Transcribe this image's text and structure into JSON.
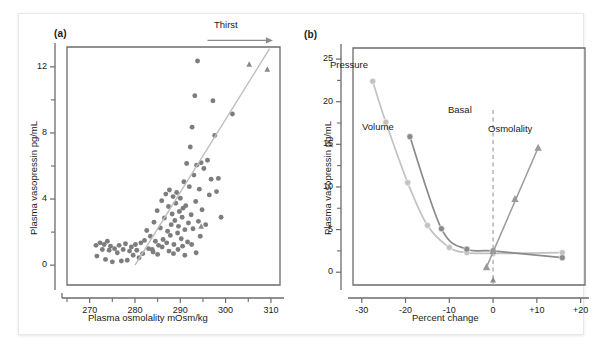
{
  "figure": {
    "panels": [
      {
        "letter": "(a)",
        "annotation": "Thirst",
        "xlabel": "Plasma osmolality mOsm/kg",
        "ylabel": "Plasma vasopressin pg/mL"
      },
      {
        "letter": "(b)",
        "annotation": "Basal",
        "xlabel": "Percent change",
        "ylabel": "Plasma vasopressin pg/mL",
        "series_labels": [
          "Pressure",
          "Volume",
          "Osmolality"
        ]
      }
    ]
  },
  "colors": {
    "frame": "#6b6b6b",
    "marker_dark": "#7d7d7d",
    "marker_light": "#b9b9b9",
    "line_light": "#c2c2c2",
    "line_dark": "#8a8a8a",
    "text": "#1a1a1a",
    "dashed": "#a8a8a8"
  },
  "chart_data": [
    {
      "type": "scatter",
      "panel": "(a)",
      "title": "",
      "xlabel": "Plasma osmolality mOsm/kg",
      "ylabel": "Plasma vasopressin pg/mL",
      "xlim": [
        265,
        312
      ],
      "ylim": [
        -1.2,
        13.2
      ],
      "xticks": [
        270,
        280,
        290,
        300,
        310
      ],
      "xminorticks": [
        265,
        275,
        285,
        295,
        305
      ],
      "yticks": [
        0,
        4,
        8,
        12
      ],
      "yminorticks": [
        2,
        6,
        10
      ],
      "grid": false,
      "legend": false,
      "annotations": [
        {
          "text": "Thirst",
          "type": "arrow",
          "x_start": 296,
          "x_end": 310,
          "y": 13.6
        }
      ],
      "series": [
        {
          "name": "circles",
          "marker": "circle",
          "color": "#7d7d7d",
          "points": [
            [
              271.4,
              1.2
            ],
            [
              271.6,
              0.55
            ],
            [
              272.3,
              1.35
            ],
            [
              272.8,
              0.95
            ],
            [
              273.2,
              1.25
            ],
            [
              273.5,
              0.35
            ],
            [
              273.9,
              1.45
            ],
            [
              274.3,
              0.9
            ],
            [
              274.6,
              1.15
            ],
            [
              275.0,
              0.2
            ],
            [
              275.5,
              1.0
            ],
            [
              276.1,
              0.75
            ],
            [
              276.5,
              1.2
            ],
            [
              277.0,
              0.25
            ],
            [
              277.4,
              0.95
            ],
            [
              277.9,
              1.3
            ],
            [
              278.3,
              0.3
            ],
            [
              278.8,
              0.85
            ],
            [
              279.2,
              1.1
            ],
            [
              279.6,
              0.6
            ],
            [
              280.1,
              1.25
            ],
            [
              280.4,
              0.9
            ],
            [
              280.9,
              0.45
            ],
            [
              281.3,
              1.35
            ],
            [
              281.7,
              0.7
            ],
            [
              282.1,
              1.5
            ],
            [
              282.6,
              2.1
            ],
            [
              283.0,
              1.0
            ],
            [
              283.4,
              1.75
            ],
            [
              283.8,
              0.95
            ],
            [
              284.2,
              2.6
            ],
            [
              284.5,
              1.45
            ],
            [
              284.9,
              3.3
            ],
            [
              285.2,
              1.2
            ],
            [
              285.6,
              2.25
            ],
            [
              285.9,
              3.9
            ],
            [
              286.2,
              1.55
            ],
            [
              286.5,
              2.85
            ],
            [
              286.8,
              4.3
            ],
            [
              287.0,
              1.35
            ],
            [
              287.2,
              2.05
            ],
            [
              287.4,
              3.55
            ],
            [
              287.6,
              4.55
            ],
            [
              287.8,
              1.8
            ],
            [
              288.0,
              2.45
            ],
            [
              288.2,
              3.1
            ],
            [
              288.4,
              4.15
            ],
            [
              288.6,
              1.25
            ],
            [
              288.8,
              2.7
            ],
            [
              289.0,
              3.75
            ],
            [
              289.2,
              4.4
            ],
            [
              289.4,
              1.95
            ],
            [
              289.6,
              2.35
            ],
            [
              289.8,
              3.25
            ],
            [
              290.0,
              4.05
            ],
            [
              290.2,
              1.6
            ],
            [
              290.4,
              2.9
            ],
            [
              290.6,
              3.45
            ],
            [
              290.8,
              5.05
            ],
            [
              291.0,
              2.15
            ],
            [
              291.2,
              3.6
            ],
            [
              291.4,
              6.15
            ],
            [
              291.6,
              1.4
            ],
            [
              291.8,
              2.55
            ],
            [
              292.0,
              4.75
            ],
            [
              292.2,
              7.15
            ],
            [
              292.4,
              3.05
            ],
            [
              292.6,
              8.35
            ],
            [
              292.8,
              2.2
            ],
            [
              293.0,
              5.45
            ],
            [
              293.2,
              10.25
            ],
            [
              293.4,
              3.85
            ],
            [
              293.6,
              6.05
            ],
            [
              293.8,
              12.35
            ],
            [
              294.0,
              2.65
            ],
            [
              294.2,
              4.6
            ],
            [
              294.4,
              1.75
            ],
            [
              294.6,
              6.2
            ],
            [
              294.8,
              3.35
            ],
            [
              295.2,
              5.85
            ],
            [
              295.6,
              2.45
            ],
            [
              296.0,
              6.35
            ],
            [
              296.4,
              4.25
            ],
            [
              296.8,
              5.2
            ],
            [
              297.2,
              9.95
            ],
            [
              297.6,
              7.85
            ],
            [
              298.0,
              4.45
            ],
            [
              298.4,
              5.25
            ],
            [
              299.0,
              2.9
            ],
            [
              301.5,
              9.15
            ],
            [
              286.0,
              1.1
            ],
            [
              287.5,
              0.85
            ],
            [
              289.5,
              0.95
            ],
            [
              290.5,
              1.15
            ],
            [
              292.5,
              1.25
            ],
            [
              284.0,
              0.8
            ],
            [
              285.0,
              0.65
            ],
            [
              288.5,
              0.7
            ],
            [
              291.0,
              0.6
            ],
            [
              293.5,
              0.75
            ]
          ]
        },
        {
          "name": "triangles",
          "marker": "triangle",
          "color": "#8a8a8a",
          "points": [
            [
              294.6,
              2.35
            ],
            [
              305.2,
              12.15
            ],
            [
              309.2,
              11.85
            ]
          ]
        },
        {
          "name": "regression-line",
          "marker": "line",
          "color": "#bdbdbd",
          "points": [
            [
              280.0,
              0.0
            ],
            [
              309.7,
              13.1
            ]
          ]
        }
      ]
    },
    {
      "type": "line",
      "panel": "(b)",
      "title": "",
      "xlabel": "Percent change",
      "ylabel": "Plasma vasopressin pg/mL",
      "xlim": [
        -32,
        21
      ],
      "ylim": [
        -1.5,
        26.3
      ],
      "xticks": [
        -30,
        -20,
        -10,
        0,
        10,
        20
      ],
      "xticklabels": [
        "-30",
        "-20",
        "-10",
        "0",
        "+10",
        "+20"
      ],
      "yticks": [
        0,
        5,
        10,
        15,
        20,
        25
      ],
      "yminorticks": [
        2.5,
        7.5,
        12.5,
        17.5,
        22.5
      ],
      "grid": false,
      "legend_position": "inline-labels",
      "annotations": [
        {
          "text": "Basal",
          "type": "vline",
          "x": 0
        },
        {
          "text": "Pressure",
          "type": "series-label"
        },
        {
          "text": "Volume",
          "type": "series-label"
        },
        {
          "text": "Osmolality",
          "type": "series-label"
        }
      ],
      "series": [
        {
          "name": "Pressure",
          "marker": "circle",
          "color": "#c2c2c2",
          "x": [
            -27.5,
            -24.5,
            -19.5,
            -15.0,
            -10.0,
            -6.0,
            0.0,
            15.8
          ],
          "values": [
            22.4,
            17.6,
            10.5,
            5.5,
            2.9,
            2.3,
            2.2,
            2.3
          ]
        },
        {
          "name": "Volume",
          "marker": "circle",
          "color": "#8a8a8a",
          "x": [
            -19.0,
            -11.8,
            -6.0,
            0.0,
            15.8
          ],
          "values": [
            15.9,
            5.1,
            2.7,
            2.5,
            1.7
          ]
        },
        {
          "name": "Osmolality",
          "marker": "triangle",
          "color": "#9a9a9a",
          "x": [
            -1.5,
            0.0,
            5.0,
            10.3
          ],
          "values": [
            0.6,
            2.5,
            8.6,
            14.6
          ]
        },
        {
          "name": "Basal-marker",
          "marker": "triangle-small",
          "color": "#8a8a8a",
          "x": [
            0.0
          ],
          "values": [
            -0.9
          ]
        }
      ]
    }
  ]
}
